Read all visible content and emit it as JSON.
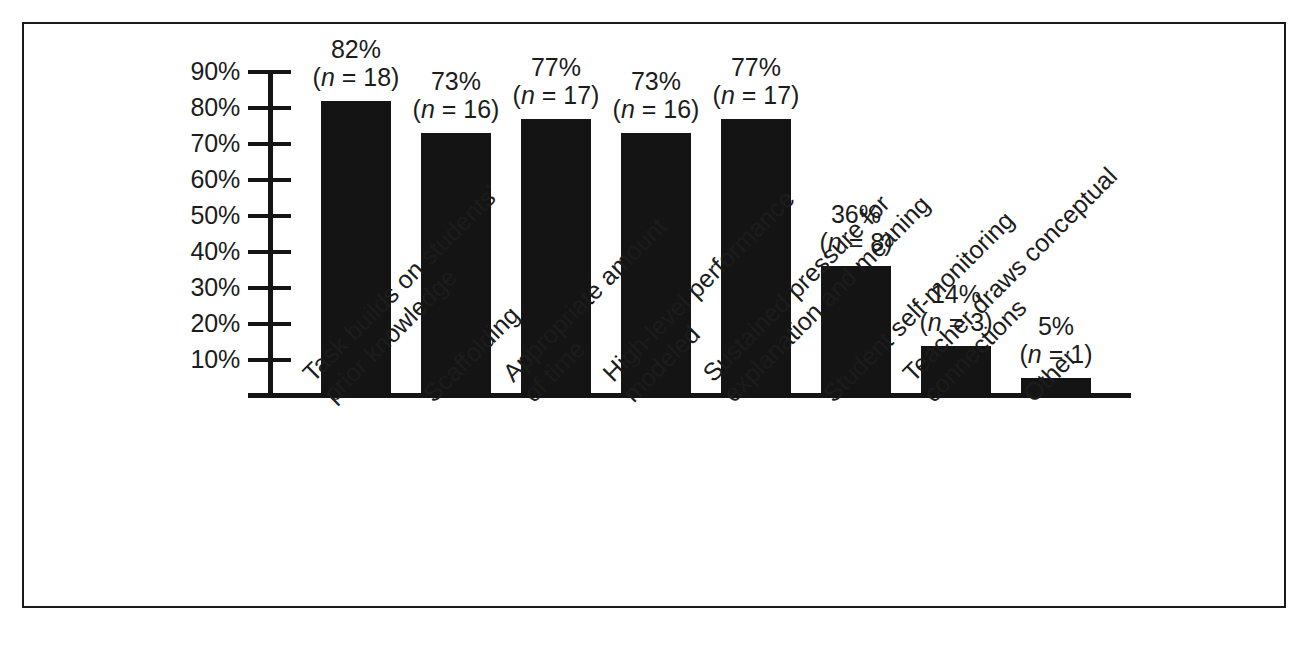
{
  "figure": {
    "frame": true,
    "background_color": "#ffffff",
    "bar_color": "#141414",
    "axis_color": "#141414"
  },
  "chart_data": {
    "type": "bar",
    "title": "",
    "subtitle": "",
    "xlabel": "",
    "ylabel": "",
    "ylim": [
      0,
      95
    ],
    "grid": false,
    "legend": null,
    "ytick_labels": [
      "90%",
      "80%",
      "70%",
      "60%",
      "50%",
      "40%",
      "30%",
      "20%",
      "10%"
    ],
    "ytick_values": [
      90,
      80,
      70,
      60,
      50,
      40,
      30,
      20,
      10
    ],
    "categories": [
      "Task builds on students’ prior knowledge",
      "Scaffolding",
      "Appropriate amount of time",
      "High-level performance modeled",
      "Sustained pressure for explanation and meaning",
      "Student self-monitoring",
      "Teacher draws conceptual connections",
      "Other"
    ],
    "category_lines": [
      [
        "Task builds on students’",
        "prior knowledge"
      ],
      [
        "Scaffolding"
      ],
      [
        "Appropriate amount",
        "of time"
      ],
      [
        "High-level performance",
        "modeled"
      ],
      [
        "Sustained pressure for",
        "explanation and meaning"
      ],
      [
        "Student self-monitoring"
      ],
      [
        "Teacher draws conceptual",
        "connections"
      ],
      [
        "Other"
      ]
    ],
    "values": [
      82,
      73,
      77,
      73,
      77,
      36,
      14,
      5
    ],
    "counts": [
      18,
      16,
      17,
      16,
      17,
      8,
      3,
      1
    ],
    "value_labels": [
      "82%",
      "73%",
      "77%",
      "73%",
      "77%",
      "36%",
      "14%",
      "5%"
    ],
    "count_labels": [
      "(n = 18)",
      "(n = 16)",
      "(n = 17)",
      "(n = 16)",
      "(n = 17)",
      "(n = 8)",
      "(n = 3)",
      "(n = 1)"
    ],
    "annotations": [
      {
        "value_label": "82%",
        "count_prefix": "(",
        "count_n": "n",
        "count_rest": " = 18)"
      },
      {
        "value_label": "73%",
        "count_prefix": "(",
        "count_n": "n",
        "count_rest": " = 16)"
      },
      {
        "value_label": "77%",
        "count_prefix": "(",
        "count_n": "n",
        "count_rest": " = 17)"
      },
      {
        "value_label": "73%",
        "count_prefix": "(",
        "count_n": "n",
        "count_rest": " = 16)"
      },
      {
        "value_label": "77%",
        "count_prefix": "(",
        "count_n": "n",
        "count_rest": " = 17)"
      },
      {
        "value_label": "36%",
        "count_prefix": "(",
        "count_n": "n",
        "count_rest": " = 8)"
      },
      {
        "value_label": "14%",
        "count_prefix": "(",
        "count_n": "n",
        "count_rest": " = 3)"
      },
      {
        "value_label": "5%",
        "count_prefix": "(",
        "count_n": "n",
        "count_rest": " = 1)"
      }
    ]
  }
}
